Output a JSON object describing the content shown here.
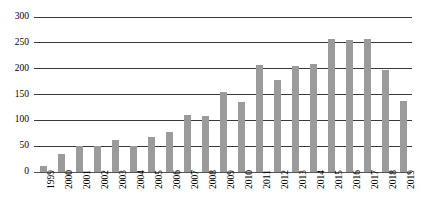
{
  "chart_data": {
    "type": "bar",
    "title": "",
    "subtitle": "",
    "xlabel": "",
    "ylabel": "",
    "categories": [
      "1999",
      "2000",
      "2001",
      "2002",
      "2003",
      "2004",
      "2005",
      "2006",
      "2007",
      "2008",
      "2009",
      "2010",
      "2011",
      "2012",
      "2013",
      "2014",
      "2015",
      "2016",
      "2017",
      "2018",
      "2019"
    ],
    "values": [
      12,
      35,
      50,
      50,
      62,
      50,
      68,
      78,
      110,
      108,
      155,
      135,
      207,
      178,
      205,
      210,
      258,
      255,
      258,
      198,
      138
    ],
    "ylim": [
      0,
      300
    ],
    "ytick_labels": [
      "0",
      "50",
      "100",
      "150",
      "200",
      "250",
      "300"
    ],
    "ytick_values": [
      0,
      50,
      100,
      150,
      200,
      250,
      300
    ],
    "grid": true,
    "grid_axis": "y",
    "legend": false,
    "legend_position": "none",
    "series": [
      {
        "name": "",
        "color": "#9b9b9b",
        "values": [
          12,
          35,
          50,
          50,
          62,
          50,
          68,
          78,
          110,
          108,
          155,
          135,
          207,
          178,
          205,
          210,
          258,
          255,
          258,
          198,
          138
        ]
      }
    ],
    "colors": {
      "bar": "#9b9b9b",
      "gridline": "#3a3a3a",
      "axis": "#555555",
      "text": "#000000",
      "background": "#ffffff"
    }
  }
}
